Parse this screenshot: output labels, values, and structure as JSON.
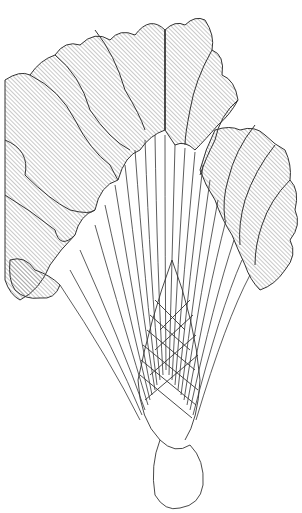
{
  "image": {
    "subject": "line drawing of a fan-shaped plant with hatched wavy leaves, many slender stalks converging into a braided twisted base",
    "background_color": "#ffffff",
    "stroke_color": "#333333",
    "hatch_color": "#6a6a6a"
  }
}
